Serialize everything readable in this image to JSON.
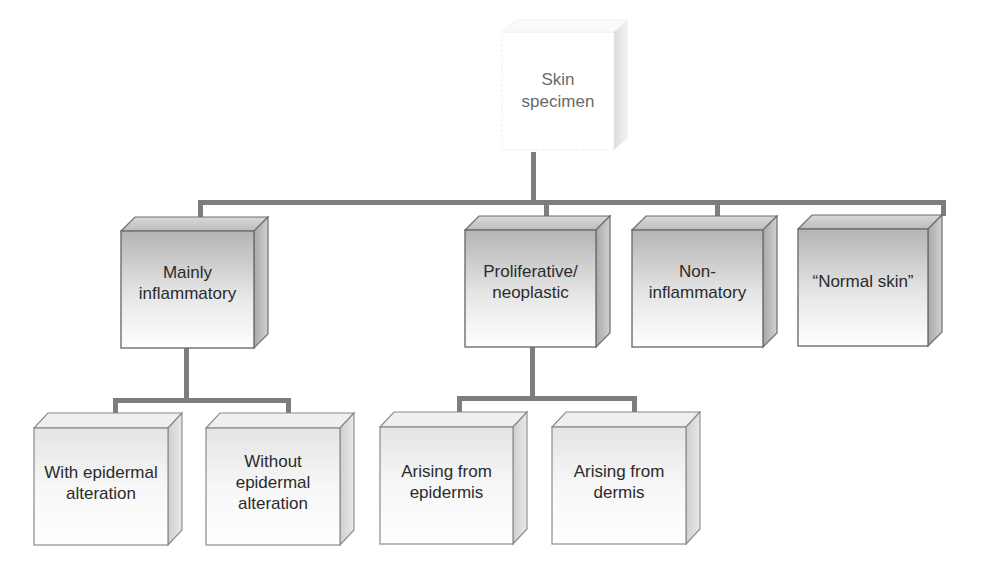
{
  "diagram": {
    "type": "hierarchy-tree",
    "root": {
      "id": "skin-specimen",
      "lines": [
        "Skin",
        "specimen"
      ]
    },
    "level1": [
      {
        "id": "mainly-inflammatory",
        "lines": [
          "Mainly",
          "inflammatory"
        ]
      },
      {
        "id": "proliferative-neoplastic",
        "lines": [
          "Proliferative/",
          "neoplastic"
        ]
      },
      {
        "id": "non-inflammatory",
        "lines": [
          "Non-",
          "inflammatory"
        ]
      },
      {
        "id": "normal-skin",
        "lines": [
          "“Normal skin”"
        ]
      }
    ],
    "level2": [
      {
        "id": "with-epidermal-alteration",
        "parent": "mainly-inflammatory",
        "lines": [
          "With epidermal",
          "alteration"
        ]
      },
      {
        "id": "without-epidermal-alteration",
        "parent": "mainly-inflammatory",
        "lines": [
          "Without",
          "epidermal",
          "alteration"
        ]
      },
      {
        "id": "arising-from-epidermis",
        "parent": "proliferative-neoplastic",
        "lines": [
          "Arising from",
          "epidermis"
        ]
      },
      {
        "id": "arising-from-dermis",
        "parent": "proliferative-neoplastic",
        "lines": [
          "Arising from",
          "dermis"
        ]
      }
    ]
  },
  "colors": {
    "connector": "#7d7d7d",
    "box_edge": "#6e6e6e",
    "level1_face_top": "#b9b9b9",
    "level1_face_bottom": "#ffffff",
    "level2_face": "#f2f2f2",
    "text": "#2b2b2b"
  }
}
